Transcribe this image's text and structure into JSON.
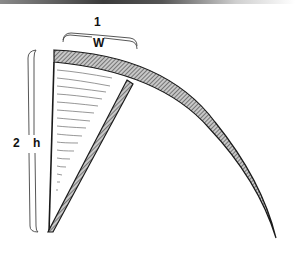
{
  "diagram": {
    "labels": {
      "width_number": "1",
      "width_symbol": "W",
      "height_number": "2",
      "height_symbol": "h"
    },
    "colors": {
      "stroke": "#1a1a1a",
      "hatch_fill": "#9a9a9a",
      "water_lines": "#555555",
      "background": "#ffffff"
    },
    "elements": [
      "arched-shell-strip",
      "inner-triangular-wedge",
      "diagonal-support-strip",
      "width-dimension-brace",
      "height-dimension-brace"
    ]
  }
}
